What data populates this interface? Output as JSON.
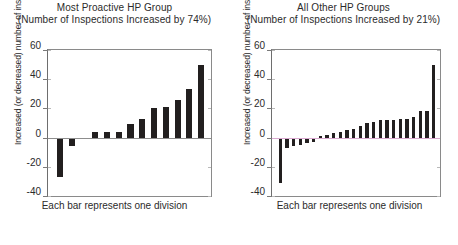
{
  "figure": {
    "caption_left": "Each bar represents one division",
    "caption_right": "Each bar represents one division",
    "ylabel": "Increased (or decreased) number of inspections"
  },
  "panels": {
    "left": {
      "title": "Most Proactive HP Group",
      "subtitle": "(Number of Inspections Increased by 74%)",
      "yticks": [
        "60",
        "40",
        "20",
        "0",
        "-20",
        "-40"
      ]
    },
    "right": {
      "title": "All Other HP Groups",
      "subtitle": "(Number of Inspections Increased by 21%)",
      "yticks": [
        "60",
        "40",
        "20",
        "0",
        "-20",
        "-40"
      ]
    }
  },
  "colors": {
    "bar": "#221f1f",
    "axis": "#8a8a8a",
    "zero_line_left": "#8d8d8d",
    "zero_line_right": "#d9a8cf",
    "text": "#2b2b2b",
    "background": "#ffffff"
  },
  "chart_data": [
    {
      "type": "bar",
      "id": "most-proactive-hp-group",
      "title": "Most Proactive HP Group",
      "subtitle": "(Number of Inspections Increased by 74%)",
      "xlabel": "Each bar represents one division",
      "ylabel": "Increased (or decreased) number of inspections",
      "ylim": [
        -40,
        60
      ],
      "yticks": [
        -40,
        -20,
        0,
        20,
        40,
        60
      ],
      "grid": false,
      "legend": "none",
      "categories": [
        "d1",
        "d2",
        "d3",
        "d4",
        "d5",
        "d6",
        "d7",
        "d8",
        "d9",
        "d10",
        "d11",
        "d12",
        "d13"
      ],
      "values": [
        -27,
        -6,
        -1,
        4,
        4,
        4,
        9,
        13,
        20,
        21,
        26,
        33,
        50
      ],
      "note": "Bars sorted ascending; each bar is one division."
    },
    {
      "type": "bar",
      "id": "all-other-hp-groups",
      "title": "All Other HP Groups",
      "subtitle": "(Number of Inspections Increased by 21%)",
      "xlabel": "Each bar represents one division",
      "ylabel": "Increased (or decreased) number of inspections",
      "ylim": [
        -40,
        60
      ],
      "yticks": [
        -40,
        -20,
        0,
        20,
        40,
        60
      ],
      "grid": false,
      "legend": "none",
      "categories": [
        "d1",
        "d2",
        "d3",
        "d4",
        "d5",
        "d6",
        "d7",
        "d8",
        "d9",
        "d10",
        "d11",
        "d12",
        "d13",
        "d14",
        "d15",
        "d16",
        "d17",
        "d18",
        "d19",
        "d20",
        "d21",
        "d22",
        "d23",
        "d24"
      ],
      "values": [
        -31,
        -7,
        -6,
        -5,
        -4,
        -3,
        1,
        2,
        3,
        4,
        5,
        6,
        8,
        10,
        11,
        12,
        12,
        12,
        13,
        13,
        14,
        18,
        18,
        50
      ],
      "note": "Bars sorted ascending; each bar is one division."
    }
  ]
}
